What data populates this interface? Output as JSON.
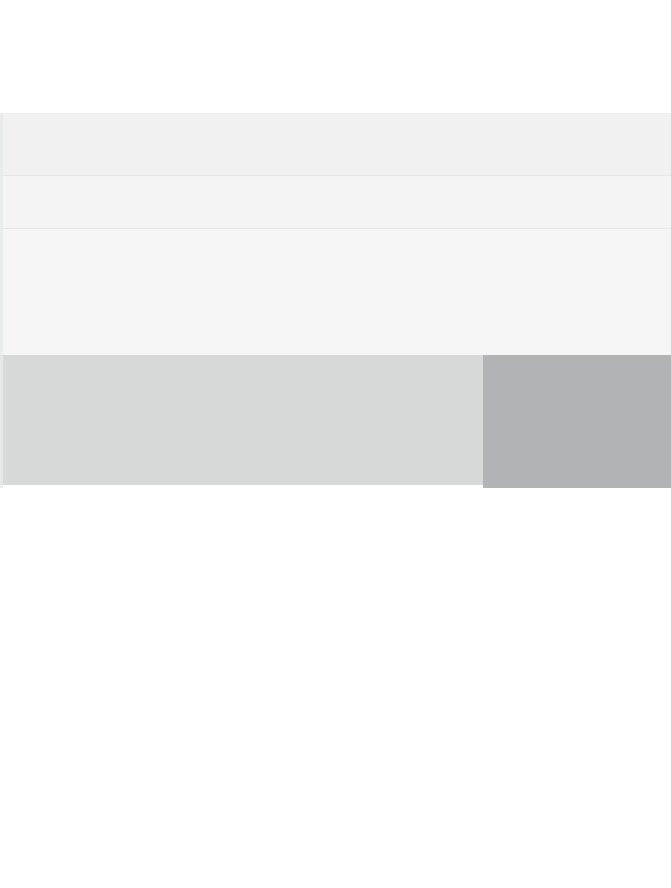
{
  "page": {
    "width_px": 671,
    "height_px": 888,
    "background_color": "#ffffff"
  },
  "colors": {
    "page_background": "#ffffff",
    "panel_background": "#f3f3f3",
    "row_a": "#f1f1f1",
    "row_b": "#f4f4f4",
    "row_c": "#f5f5f5",
    "row_divider": "#e6e6e6",
    "band_light": "#d7d8d8",
    "band_dark": "#b2b3b4",
    "left_gutter": "#e9eaea"
  },
  "regions": {
    "top_margin": {
      "top": 0,
      "height": 113
    },
    "panel": {
      "top": 113,
      "height": 242
    },
    "rows": [
      {
        "name": "row-a",
        "top": 113,
        "height": 62
      },
      {
        "name": "row-b",
        "top": 176,
        "height": 52
      },
      {
        "name": "row-c",
        "top": 229,
        "height": 126
      }
    ],
    "dividers": [
      {
        "name": "divider-upper",
        "top": 175
      },
      {
        "name": "divider-lower",
        "top": 228
      }
    ],
    "band_light": {
      "top": 355,
      "height": 130,
      "left": 0,
      "width": 671
    },
    "band_dark": {
      "top": 355,
      "height": 133,
      "left": 483,
      "width": 188
    },
    "left_gutter": {
      "top": 113,
      "height": 375,
      "left": 0,
      "width": 3
    },
    "blank_area": {
      "top": 488,
      "height": 400
    }
  },
  "content": {
    "text_visible": "",
    "note": ""
  }
}
